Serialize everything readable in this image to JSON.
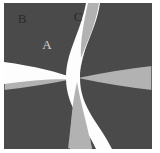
{
  "figure": {
    "canvas": {
      "width": 160,
      "height": 153
    },
    "colors": {
      "page_background": "#ffffff",
      "panel_background": "#b2b2b2",
      "panel_border": "#6b6b6b",
      "petal_fill": "#4a4a4a",
      "band_fill": "#fdfdfd",
      "label_light": "#d8d8d8",
      "label_dark": "#2a2a2a"
    },
    "panel": {
      "x": 4,
      "y": 3,
      "width": 148,
      "height": 146,
      "border_width": 1
    },
    "labels": [
      {
        "id": "A",
        "text": "A",
        "x": 47,
        "y": 44,
        "color": "#d8d8d8",
        "size": 13,
        "region": "upper-left-petal"
      },
      {
        "id": "B",
        "text": "B",
        "x": 22,
        "y": 18,
        "color": "#2a2a2a",
        "size": 13,
        "region": "upper-left-background"
      },
      {
        "id": "C",
        "text": "C",
        "x": 78,
        "y": 16,
        "color": "#2a2a2a",
        "size": 13,
        "region": "top-wedge"
      }
    ],
    "petals": [
      {
        "id": "petal-upper-left",
        "corner": [
          4,
          3
        ],
        "apex": [
          78,
          78
        ]
      },
      {
        "id": "petal-upper-right",
        "corner": [
          152,
          3
        ],
        "apex": [
          78,
          78
        ]
      },
      {
        "id": "petal-lower-right",
        "corner": [
          152,
          149
        ],
        "apex": [
          78,
          78
        ]
      },
      {
        "id": "petal-lower-left",
        "corner": [
          4,
          149
        ],
        "apex": [
          78,
          78
        ]
      }
    ],
    "bands": [
      {
        "id": "band-vertical-curve",
        "from": "top-edge",
        "to": "bottom-edge",
        "through": [
          78,
          78
        ]
      },
      {
        "id": "band-horizontal-curve",
        "from": "left-edge",
        "to": "center",
        "through": [
          78,
          78
        ]
      }
    ]
  }
}
